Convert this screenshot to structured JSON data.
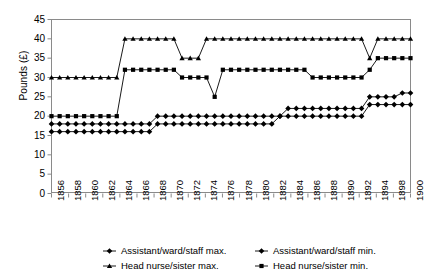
{
  "chart_data": {
    "type": "line",
    "title": "",
    "xlabel": "",
    "ylabel": "Pounds (£)",
    "ylim": [
      0,
      45
    ],
    "ytick_step": 5,
    "yticks": [
      0,
      5,
      10,
      15,
      20,
      25,
      30,
      35,
      40,
      45
    ],
    "grid": false,
    "legend_position": "bottom",
    "x_start": 1856,
    "x_end": 1900,
    "xtick_labels": [
      "1856",
      "1858",
      "1860",
      "1862",
      "1864",
      "1866",
      "1868",
      "1870",
      "1872",
      "1874",
      "1876",
      "1878",
      "1880",
      "1882",
      "1884",
      "1886",
      "1888",
      "1890",
      "1892",
      "1894",
      "1898",
      "1900"
    ],
    "x": [
      1856,
      1857,
      1858,
      1859,
      1860,
      1861,
      1862,
      1863,
      1864,
      1865,
      1866,
      1867,
      1868,
      1869,
      1870,
      1871,
      1872,
      1873,
      1874,
      1875,
      1876,
      1877,
      1878,
      1879,
      1880,
      1881,
      1882,
      1883,
      1884,
      1885,
      1886,
      1887,
      1888,
      1889,
      1890,
      1891,
      1892,
      1893,
      1894,
      1895,
      1896,
      1897,
      1898,
      1899,
      1900
    ],
    "series": [
      {
        "name": "Assistant/ward/staff max.",
        "marker": "diamond",
        "values": [
          18,
          18,
          18,
          18,
          18,
          18,
          18,
          18,
          18,
          18,
          18,
          18,
          18,
          20,
          20,
          20,
          20,
          20,
          20,
          20,
          20,
          20,
          20,
          20,
          20,
          20,
          20,
          20,
          20,
          22,
          22,
          22,
          22,
          22,
          22,
          22,
          22,
          22,
          22,
          25,
          25,
          25,
          25,
          26,
          26
        ]
      },
      {
        "name": "Assistant/ward/staff min.",
        "marker": "diamond",
        "values": [
          16,
          16,
          16,
          16,
          16,
          16,
          16,
          16,
          16,
          16,
          16,
          16,
          16,
          18,
          18,
          18,
          18,
          18,
          18,
          18,
          18,
          18,
          18,
          18,
          18,
          18,
          18,
          18,
          20,
          20,
          20,
          20,
          20,
          20,
          20,
          20,
          20,
          20,
          20,
          23,
          23,
          23,
          23,
          23,
          23
        ]
      },
      {
        "name": "Head nurse/sister max.",
        "marker": "triangle",
        "values": [
          30,
          30,
          30,
          30,
          30,
          30,
          30,
          30,
          30,
          40,
          40,
          40,
          40,
          40,
          40,
          40,
          35,
          35,
          35,
          40,
          40,
          40,
          40,
          40,
          40,
          40,
          40,
          40,
          40,
          40,
          40,
          40,
          40,
          40,
          40,
          40,
          40,
          40,
          40,
          35,
          40,
          40,
          40,
          40,
          40
        ]
      },
      {
        "name": "Head nurse/sister min.",
        "marker": "square",
        "values": [
          20,
          20,
          20,
          20,
          20,
          20,
          20,
          20,
          20,
          32,
          32,
          32,
          32,
          32,
          32,
          32,
          30,
          30,
          30,
          30,
          25,
          32,
          32,
          32,
          32,
          32,
          32,
          32,
          32,
          32,
          32,
          32,
          30,
          30,
          30,
          30,
          30,
          30,
          30,
          32,
          35,
          35,
          35,
          35,
          35
        ]
      }
    ]
  },
  "legend": {
    "entries": [
      {
        "label": "Assistant/ward/staff max.",
        "marker": "diamond"
      },
      {
        "label": "Assistant/ward/staff min.",
        "marker": "diamond"
      },
      {
        "label": "Head nurse/sister max.",
        "marker": "triangle"
      },
      {
        "label": "Head nurse/sister min.",
        "marker": "square"
      }
    ]
  },
  "colors": {
    "series": "#000000",
    "axis": "#8a8a8a",
    "background": "#ffffff",
    "text": "#000000"
  }
}
